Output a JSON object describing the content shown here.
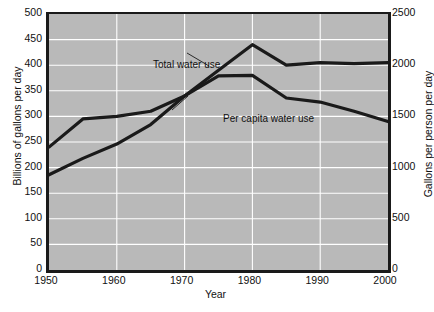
{
  "chart_data": {
    "type": "line",
    "title": "",
    "xlabel": "Year",
    "ylabel": "Billions of gallons per day",
    "ylabel_right": "Gallons per person per day",
    "xlim": [
      1950,
      2000
    ],
    "ylim": [
      0,
      500
    ],
    "ylim_right": [
      0,
      2500
    ],
    "grid": true,
    "legend_position": "inline-annotations",
    "xticks": [
      "1950",
      "1960",
      "1970",
      "1980",
      "1990",
      "2000"
    ],
    "xtick_values": [
      1950,
      1960,
      1970,
      1980,
      1990,
      2000
    ],
    "yticks_left": [
      "0",
      "50",
      "100",
      "150",
      "200",
      "250",
      "300",
      "350",
      "400",
      "450",
      "500"
    ],
    "ytick_values_left": [
      0,
      50,
      100,
      150,
      200,
      250,
      300,
      350,
      400,
      450,
      500
    ],
    "yticks_right": [
      "0",
      "500",
      "1000",
      "1500",
      "2000",
      "2500"
    ],
    "ytick_values_right": [
      0,
      500,
      1000,
      1500,
      2000,
      2500
    ],
    "x": [
      1950,
      1955,
      1960,
      1965,
      1970,
      1975,
      1980,
      1985,
      1990,
      1995,
      2000
    ],
    "series": [
      {
        "name": "Total water use",
        "axis": "left",
        "units": "Billions of gallons per day",
        "values": [
          240,
          295,
          300,
          310,
          340,
          390,
          440,
          400,
          405,
          403,
          405
        ],
        "color": "#1a1a1a"
      },
      {
        "name": "Per capita water use",
        "axis": "right",
        "units": "Gallons per person per day",
        "values": [
          930,
          1090,
          1230,
          1420,
          1700,
          1895,
          1900,
          1680,
          1640,
          1550,
          1450
        ],
        "color": "#1a1a1a"
      }
    ],
    "annotations": [
      {
        "id": "total",
        "text": "Total water use"
      },
      {
        "id": "percap",
        "text": "Per capita water use"
      }
    ],
    "style": {
      "plot_background": "#b9b9b9",
      "gridline_color": "#ffffff",
      "line_color": "#1a1a1a",
      "axis_color": "#1a1a1a",
      "page_background": "#ffffff"
    }
  },
  "source_note": ""
}
